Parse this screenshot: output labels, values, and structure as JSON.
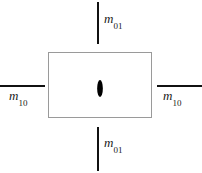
{
  "figure": {
    "background_color": "#ffffff",
    "rect_border_color": "#9a9a9a",
    "line_color": "#111111",
    "lens_color": "#000000"
  },
  "labels": {
    "top": {
      "symbol": "m",
      "subscript": "01",
      "full": "m01"
    },
    "bottom": {
      "symbol": "m",
      "subscript": "01",
      "full": "m01"
    },
    "left": {
      "symbol": "m",
      "subscript": "10",
      "full": "m10"
    },
    "right": {
      "symbol": "m",
      "subscript": "10",
      "full": "m10"
    }
  }
}
